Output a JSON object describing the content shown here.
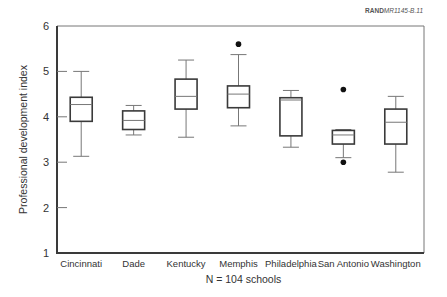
{
  "credit": {
    "org": "RAND",
    "id": "MR1145-B.11"
  },
  "chart_data": {
    "type": "box",
    "title": "",
    "xlabel": "N = 104 schools",
    "ylabel": "Professional development index",
    "ylim": [
      1,
      6
    ],
    "yticks": [
      1,
      2,
      3,
      4,
      5,
      6
    ],
    "grid": false,
    "legend": null,
    "categories": [
      "Cincinnati",
      "Dade",
      "Kentucky",
      "Memphis",
      "Philadelphia",
      "San Antonio",
      "Washington"
    ],
    "boxes": [
      {
        "name": "Cincinnati",
        "whisker_low": 3.13,
        "q1": 3.9,
        "median": 4.27,
        "q3": 4.43,
        "whisker_high": 5.0,
        "outliers": []
      },
      {
        "name": "Dade",
        "whisker_low": 3.6,
        "q1": 3.72,
        "median": 3.92,
        "q3": 4.13,
        "whisker_high": 4.25,
        "outliers": []
      },
      {
        "name": "Kentucky",
        "whisker_low": 3.55,
        "q1": 4.17,
        "median": 4.45,
        "q3": 4.83,
        "whisker_high": 5.25,
        "outliers": []
      },
      {
        "name": "Memphis",
        "whisker_low": 3.8,
        "q1": 4.2,
        "median": 4.5,
        "q3": 4.68,
        "whisker_high": 5.37,
        "outliers": [
          5.6
        ]
      },
      {
        "name": "Philadelphia",
        "whisker_low": 3.33,
        "q1": 3.58,
        "median": 4.37,
        "q3": 4.42,
        "whisker_high": 4.58,
        "outliers": []
      },
      {
        "name": "San Antonio",
        "whisker_low": 3.1,
        "q1": 3.4,
        "median": 3.6,
        "q3": 3.7,
        "whisker_high": 3.72,
        "outliers": [
          4.6,
          3.0
        ]
      },
      {
        "name": "Washington",
        "whisker_low": 2.78,
        "q1": 3.4,
        "median": 3.88,
        "q3": 4.17,
        "whisker_high": 4.45,
        "outliers": []
      }
    ]
  }
}
